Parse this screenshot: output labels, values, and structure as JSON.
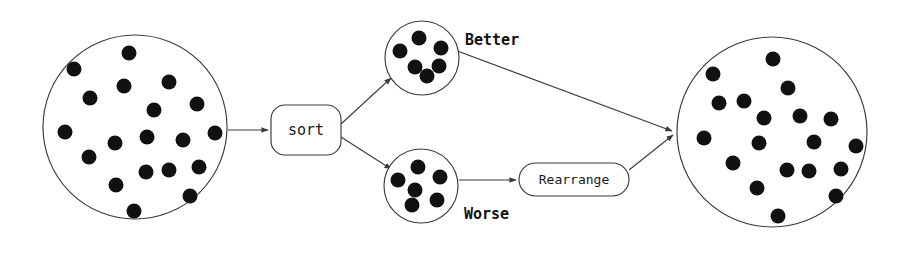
{
  "diagram": {
    "background_color": "#ffffff",
    "stroke_color": "#3a3a3a",
    "dot_color": "#111111",
    "nodes": {
      "input_pool": {
        "type": "circle-of-dots",
        "name": "input-pool",
        "cx": 135,
        "cy": 127,
        "r": 92,
        "dot_count": 22,
        "dot_radius": 7.5,
        "dots": [
          [
            129,
            53
          ],
          [
            74,
            69
          ],
          [
            124,
            86
          ],
          [
            169,
            82
          ],
          [
            90,
            98
          ],
          [
            154,
            110
          ],
          [
            197,
            104
          ],
          [
            65,
            132
          ],
          [
            147,
            137
          ],
          [
            115,
            143
          ],
          [
            183,
            140
          ],
          [
            215,
            133
          ],
          [
            89,
            157
          ],
          [
            146,
            172
          ],
          [
            169,
            170
          ],
          [
            199,
            167
          ],
          [
            116,
            185
          ],
          [
            190,
            196
          ],
          [
            134,
            211
          ]
        ]
      },
      "sort_box": {
        "type": "rounded-box",
        "name": "sort-node",
        "label": "sort",
        "x": 271,
        "y": 105,
        "width": 70,
        "height": 50,
        "rx": 14,
        "font_size": 15
      },
      "better_pool": {
        "type": "circle-of-dots",
        "name": "better-pool",
        "cx": 422,
        "cy": 58,
        "r": 37,
        "dot_count": 6,
        "dot_radius": 7.5,
        "dots": [
          [
            419,
            38
          ],
          [
            400,
            51
          ],
          [
            441,
            48
          ],
          [
            415,
            67
          ],
          [
            439,
            66
          ],
          [
            427,
            76
          ]
        ]
      },
      "worse_pool": {
        "type": "circle-of-dots",
        "name": "worse-pool",
        "cx": 421,
        "cy": 186,
        "r": 37,
        "dot_count": 6,
        "dot_radius": 7.5,
        "dots": [
          [
            418,
            167
          ],
          [
            398,
            180
          ],
          [
            440,
            177
          ],
          [
            415,
            190
          ],
          [
            412,
            205
          ],
          [
            437,
            200
          ]
        ]
      },
      "rearrange_box": {
        "type": "stadium-box",
        "name": "rearrange-node",
        "label": "Rearrange",
        "x": 519,
        "y": 163,
        "width": 110,
        "height": 33,
        "rx": 16,
        "font_size": 13
      },
      "output_pool": {
        "type": "circle-of-dots",
        "name": "output-pool",
        "cx": 772,
        "cy": 132,
        "r": 95,
        "dot_count": 22,
        "dot_radius": 7.5,
        "dots": [
          [
            773,
            59
          ],
          [
            713,
            74
          ],
          [
            719,
            103
          ],
          [
            744,
            101
          ],
          [
            764,
            118
          ],
          [
            788,
            88
          ],
          [
            800,
            116
          ],
          [
            831,
            119
          ],
          [
            704,
            138
          ],
          [
            759,
            143
          ],
          [
            814,
            142
          ],
          [
            856,
            146
          ],
          [
            733,
            163
          ],
          [
            787,
            170
          ],
          [
            809,
            171
          ],
          [
            841,
            169
          ],
          [
            757,
            188
          ],
          [
            836,
            196
          ],
          [
            778,
            216
          ]
        ]
      }
    },
    "edges": [
      {
        "name": "edge-input-to-sort",
        "from": "input-pool",
        "to": "sort-node",
        "x1": 228,
        "y1": 130,
        "x2": 268,
        "y2": 130,
        "label": ""
      },
      {
        "name": "edge-sort-to-better",
        "from": "sort-node",
        "to": "better-pool",
        "x1": 341,
        "y1": 124,
        "x2": 391,
        "y2": 78,
        "label": ""
      },
      {
        "name": "edge-sort-to-worse",
        "from": "sort-node",
        "to": "worse-pool",
        "x1": 341,
        "y1": 137,
        "x2": 391,
        "y2": 169,
        "label": ""
      },
      {
        "name": "edge-better-to-output",
        "from": "better-pool",
        "to": "output-pool",
        "x1": 452,
        "y1": 49,
        "x2": 672,
        "y2": 131,
        "label": "Better"
      },
      {
        "name": "edge-worse-to-rearrange",
        "from": "worse-pool",
        "to": "rearrange-node",
        "x1": 459,
        "y1": 180,
        "x2": 516,
        "y2": 180,
        "label": "Worse"
      },
      {
        "name": "edge-rearrange-to-output",
        "from": "rearrange-node",
        "to": "output-pool",
        "x1": 629,
        "y1": 170,
        "x2": 673,
        "y2": 135,
        "label": ""
      }
    ],
    "labels": {
      "better": {
        "text": "Better",
        "x": 465,
        "y": 45,
        "font_size": 15
      },
      "worse": {
        "text": "Worse",
        "x": 464,
        "y": 219,
        "font_size": 15
      }
    }
  }
}
